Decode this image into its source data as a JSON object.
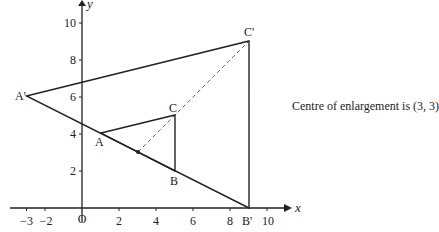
{
  "diagram": {
    "caption": "Centre of enlargement is (3, 3)",
    "axes": {
      "x_label": "x",
      "y_label": "y",
      "origin_label": "O",
      "x_ticks": [
        "−3",
        "−2",
        "2",
        "4",
        "6",
        "8",
        "10"
      ],
      "y_ticks": [
        "2",
        "4",
        "6",
        "8",
        "10"
      ]
    },
    "points": {
      "A": {
        "label": "A",
        "x": 1,
        "y": 4
      },
      "B": {
        "label": "B",
        "x": 5,
        "y": 2
      },
      "C": {
        "label": "C",
        "x": 5,
        "y": 5
      },
      "A_prime": {
        "label": "A'",
        "x": -3,
        "y": 6
      },
      "B_prime": {
        "label": "B'",
        "x": 9,
        "y": 0
      },
      "C_prime": {
        "label": "C'",
        "x": 9,
        "y": 9
      },
      "centre": {
        "x": 3,
        "y": 3
      }
    },
    "colors": {
      "line": "#222222",
      "dashed": "#666666"
    }
  }
}
